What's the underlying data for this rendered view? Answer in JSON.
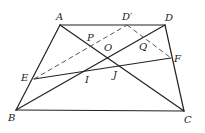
{
  "diagram": {
    "points": {
      "A": {
        "x": 60,
        "y": 25
      },
      "D_prime": {
        "x": 127,
        "y": 25
      },
      "D": {
        "x": 165,
        "y": 25
      },
      "F": {
        "x": 171,
        "y": 58
      },
      "E": {
        "x": 34,
        "y": 79
      },
      "B": {
        "x": 16,
        "y": 110
      },
      "C": {
        "x": 184,
        "y": 111
      }
    },
    "labels": {
      "A": "A",
      "D_prime": "D′",
      "D": "D",
      "P": "P",
      "O": "O",
      "Q": "Q",
      "F": "F",
      "E": "E",
      "I": "I",
      "J": "J",
      "B": "B",
      "C": "C"
    },
    "solid_segments": [
      "AD",
      "AB",
      "BC",
      "CD",
      "AC",
      "BD",
      "EF"
    ],
    "dashed_segments": [
      "ED′",
      "D′F"
    ],
    "colors": {
      "stroke": "#222222",
      "background": "#ffffff"
    }
  }
}
